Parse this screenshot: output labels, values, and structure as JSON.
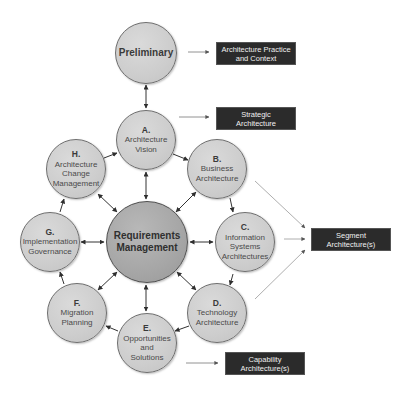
{
  "diagram": {
    "phases": {
      "preliminary": {
        "letter": "",
        "label": "Preliminary"
      },
      "a": {
        "letter": "A.",
        "label": "Architecture\nVision"
      },
      "b": {
        "letter": "B.",
        "label": "Business\nArchitecture"
      },
      "c": {
        "letter": "C.",
        "label": "Information\nSystems\nArchitectures"
      },
      "d": {
        "letter": "D.",
        "label": "Technology\nArchitecture"
      },
      "e": {
        "letter": "E.",
        "label": "Opportunities\nand\nSolutions"
      },
      "f": {
        "letter": "F.",
        "label": "Migration\nPlanning"
      },
      "g": {
        "letter": "G.",
        "label": "Implementation\nGovernance"
      },
      "h": {
        "letter": "H.",
        "label": "Architecture\nChange\nManagement"
      },
      "center": {
        "label": "Requirements\nManagement"
      }
    },
    "outputs": {
      "practice": "Architecture Practice\nand Context",
      "strategic": "Strategic\nArchitecture",
      "segment": "Segment\nArchitecture(s)",
      "capability": "Capability\nArchitecture(s)"
    },
    "colors": {
      "circle_fill": "#cdcdcd",
      "center_fill": "#a6a6a6",
      "box_fill": "#2b2b2b",
      "arrow": "#333333",
      "output_arrow": "#888888"
    }
  }
}
